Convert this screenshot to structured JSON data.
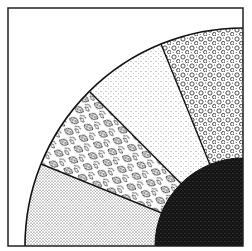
{
  "diagram": {
    "colors": {
      "background": "#ffffff",
      "line": "#111111",
      "dark_core": "#141414"
    },
    "segments": [
      {
        "name": "fine-dot-stipple",
        "texture": "fine dots"
      },
      {
        "name": "leaf-pattern",
        "texture": "leaves"
      },
      {
        "name": "sparse-stipple",
        "texture": "sparse dots"
      },
      {
        "name": "pebble-pattern",
        "texture": "pebbles"
      }
    ],
    "core": {
      "name": "dark-speckled-core",
      "texture": "dark speckle"
    }
  }
}
